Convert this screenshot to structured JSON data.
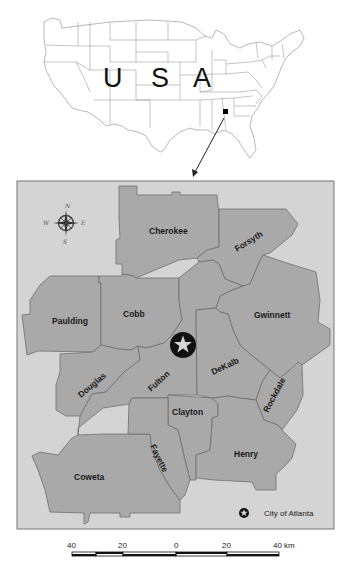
{
  "inset_map": {
    "title_letters": [
      "U",
      "S",
      "A"
    ],
    "locator_marker": "square",
    "arrow": "locator-arrow"
  },
  "main_map": {
    "background_color": "#d4d4d4",
    "county_fill": "#a9a9a9",
    "border_color": "#6f6f6f",
    "compass": {
      "icon": "compass-rose-icon",
      "north": "N",
      "south": "S",
      "east": "E",
      "west": "W"
    },
    "counties": [
      {
        "name": "Cherokee"
      },
      {
        "name": "Forsyth"
      },
      {
        "name": "Paulding"
      },
      {
        "name": "Cobb"
      },
      {
        "name": "Gwinnett"
      },
      {
        "name": "Douglas"
      },
      {
        "name": "Fulton"
      },
      {
        "name": "DeKalb"
      },
      {
        "name": "Rockdale"
      },
      {
        "name": "Clayton"
      },
      {
        "name": "Henry"
      },
      {
        "name": "Coweta"
      },
      {
        "name": "Fayette"
      }
    ],
    "city_marker": {
      "icon": "star-in-circle-icon",
      "city": "Atlanta"
    },
    "legend": {
      "icon": "star-in-circle-icon",
      "label": "City of Atlanta"
    }
  },
  "scale_bar": {
    "ticks": [
      "40",
      "20",
      "0",
      "20",
      "40 km"
    ],
    "unit": "km"
  }
}
